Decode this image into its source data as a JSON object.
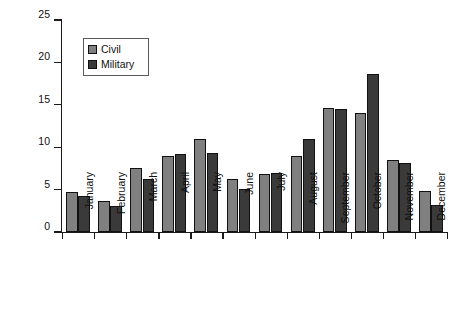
{
  "chart_data": {
    "type": "bar",
    "title": "",
    "xlabel": "",
    "ylabel": "Proportion of reported strikes (%)",
    "ylim": [
      0,
      25
    ],
    "yticks": [
      0,
      5,
      10,
      15,
      20,
      25
    ],
    "ytick_labels": [
      "0",
      "5",
      "10",
      "15",
      "20",
      "25"
    ],
    "grid": false,
    "legend_position": "upper-left-inside",
    "categories": [
      "January",
      "February",
      "March",
      "April",
      "May",
      "June",
      "July",
      "August",
      "September",
      "October",
      "November",
      "December"
    ],
    "series": [
      {
        "name": "Civil",
        "color": "#808080",
        "values": [
          4.7,
          3.7,
          7.5,
          9.0,
          11.0,
          6.3,
          6.8,
          9.0,
          14.6,
          14.0,
          8.5,
          4.8
        ]
      },
      {
        "name": "Military",
        "color": "#3a3a3a",
        "values": [
          4.2,
          3.1,
          6.2,
          9.2,
          9.3,
          5.1,
          7.0,
          11.0,
          14.5,
          18.6,
          8.1,
          3.2
        ]
      }
    ]
  },
  "legend": {
    "entries": [
      {
        "label": "Civil",
        "swatch": "civil-swatch"
      },
      {
        "label": "Military",
        "swatch": "military-swatch"
      }
    ]
  },
  "colors": {
    "civil": "#808080",
    "military": "#3a3a3a",
    "axis": "#1a1a1a",
    "background": "#ffffff"
  }
}
